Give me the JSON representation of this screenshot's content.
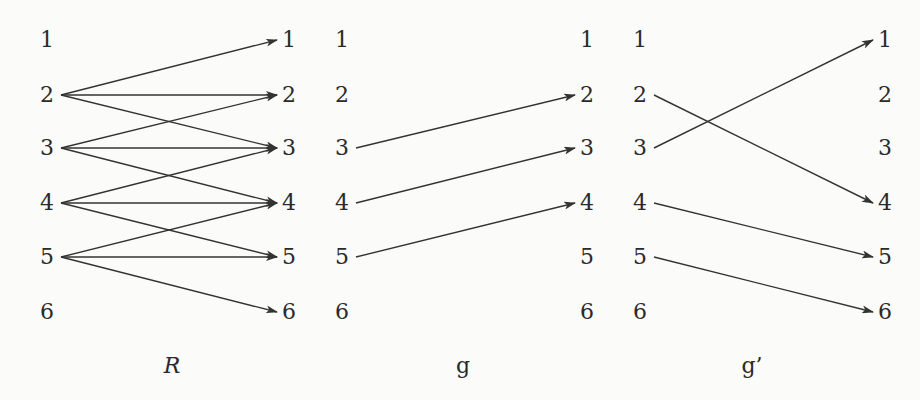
{
  "rows_y": [
    40,
    95,
    148,
    203,
    257,
    312
  ],
  "node_labels": [
    "1",
    "2",
    "3",
    "4",
    "5",
    "6"
  ],
  "edge_color": "#333333",
  "panels": [
    {
      "id": "R",
      "label": "R",
      "label_italic": true,
      "label_pos": [
        172,
        366
      ],
      "left_x": 47,
      "right_x": 289,
      "edges": [
        [
          2,
          1
        ],
        [
          2,
          2
        ],
        [
          2,
          3
        ],
        [
          3,
          2
        ],
        [
          3,
          3
        ],
        [
          3,
          4
        ],
        [
          4,
          3
        ],
        [
          4,
          4
        ],
        [
          4,
          5
        ],
        [
          5,
          4
        ],
        [
          5,
          5
        ],
        [
          5,
          6
        ]
      ]
    },
    {
      "id": "g",
      "label": "g",
      "label_italic": false,
      "label_pos": [
        463,
        366
      ],
      "left_x": 342,
      "right_x": 587,
      "edges": [
        [
          3,
          2
        ],
        [
          4,
          3
        ],
        [
          5,
          4
        ]
      ]
    },
    {
      "id": "g-prime",
      "label": "g’",
      "label_italic": false,
      "label_pos": [
        752,
        366
      ],
      "left_x": 640,
      "right_x": 885,
      "edges": [
        [
          2,
          4
        ],
        [
          3,
          1
        ],
        [
          4,
          5
        ],
        [
          5,
          6
        ]
      ]
    }
  ]
}
